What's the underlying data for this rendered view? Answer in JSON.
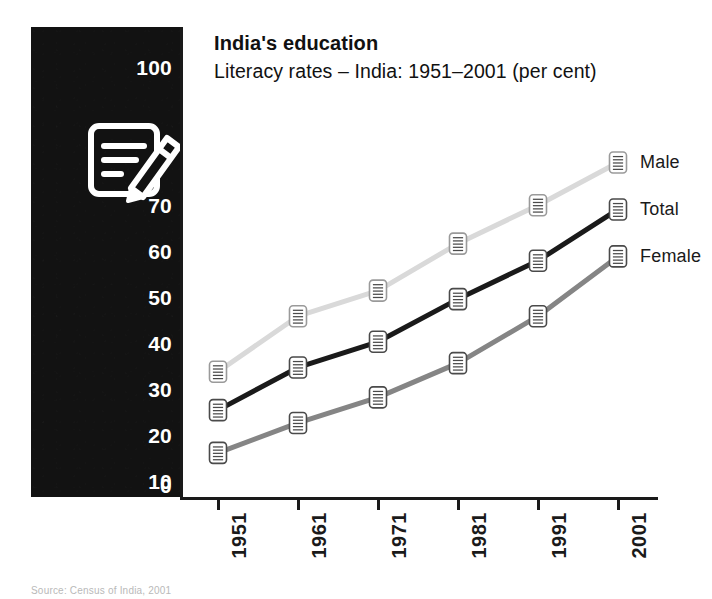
{
  "header": {
    "title": "India's education",
    "subtitle": "Literacy rates – India: 1951–2001 (per cent)"
  },
  "source": {
    "note": "Source: Census of India, 2001"
  },
  "icon": {
    "name": "document-pencil-icon",
    "color": "#ffffff",
    "panel_color": "#121212"
  },
  "axis": {
    "y_ticks": [
      "100",
      "70",
      "60",
      "50",
      "40",
      "30",
      "20",
      "10",
      "0"
    ],
    "x_ticks": [
      "1951",
      "1961",
      "1971",
      "1981",
      "1991",
      "2001"
    ]
  },
  "legend": {
    "entries": [
      {
        "label": "Male",
        "color": "#d9d9d9"
      },
      {
        "label": "Total",
        "color": "#1a1a1a"
      },
      {
        "label": "Female",
        "color": "#858585"
      }
    ]
  },
  "chart_data": {
    "type": "line",
    "title": "India's education",
    "subtitle": "Literacy rates – India: 1951–2001 (per cent)",
    "xlabel": "",
    "ylabel": "per cent",
    "categories": [
      "1951",
      "1961",
      "1971",
      "1981",
      "1991",
      "2001"
    ],
    "ylim": [
      0,
      100
    ],
    "yticks": [
      0,
      10,
      20,
      30,
      40,
      50,
      60,
      70,
      100
    ],
    "grid": false,
    "legend_position": "right-end-of-line",
    "marker": "document-icon",
    "series": [
      {
        "name": "Male",
        "color": "#d9d9d9",
        "values": [
          27,
          40,
          46,
          57,
          66,
          76
        ]
      },
      {
        "name": "Total",
        "color": "#1a1a1a",
        "values": [
          18,
          28,
          34,
          44,
          53,
          65
        ]
      },
      {
        "name": "Female",
        "color": "#858585",
        "values": [
          8,
          15,
          21,
          29,
          40,
          54
        ]
      }
    ]
  }
}
